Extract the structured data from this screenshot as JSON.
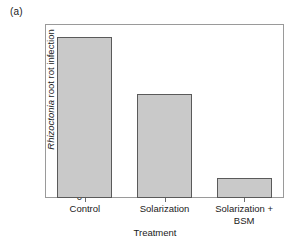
{
  "figure": {
    "panel_label": "(a)"
  },
  "chart_data": {
    "type": "bar",
    "title": "",
    "panel": "(a)",
    "categories": [
      "Control",
      "Solarization",
      "Solarization + BSM"
    ],
    "category_lines": [
      [
        "Control"
      ],
      [
        "Solarization"
      ],
      [
        "Solarization +",
        "BSM"
      ]
    ],
    "values": [
      12.9,
      8.3,
      1.6
    ],
    "xlabel": "Treatment",
    "ylabel": "Rhizoctonia root rot infection",
    "ylabel_italic_part": "Rhizoctonia",
    "ylabel_plain_part": "root rot infection",
    "ylim": [
      0,
      13.9
    ],
    "yticks": [
      0,
      3,
      6,
      9,
      12
    ],
    "ytick_labels": [
      "0",
      "3",
      "6",
      "9",
      "12"
    ],
    "grid": false,
    "legend": null,
    "bar_fill_color": "#c9c9c9",
    "bar_edge_color": "#5a5a5a",
    "axis_color": "#9a9a9a",
    "background_color": "#ffffff"
  }
}
